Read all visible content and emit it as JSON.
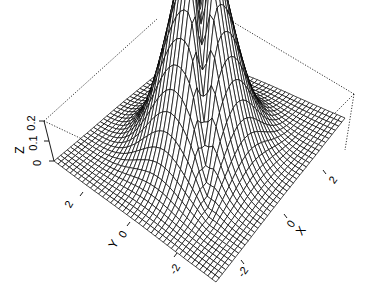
{
  "chart_data": {
    "type": "surface3d",
    "title": "",
    "function_description": "perspective mesh of a density-like surface peaking near the origin with a ridge along the back diagonal",
    "x": {
      "label": "X",
      "ticks": [
        -2,
        0,
        2
      ],
      "range": [
        -3,
        3
      ]
    },
    "y": {
      "label": "Y",
      "ticks": [
        -2,
        0,
        2
      ],
      "range": [
        -3,
        3
      ]
    },
    "z": {
      "label": "Z",
      "ticks": [
        0,
        0.1,
        0.2
      ],
      "range": [
        0,
        0.25
      ]
    },
    "grid_n": 40,
    "box": true,
    "box_style": "dotted",
    "mesh_color": "#000000",
    "background": "#ffffff"
  },
  "labels": {
    "z_axis": "Z",
    "z_ticks": [
      "0",
      "0.1",
      "0.2"
    ],
    "y_axis": "Y",
    "y_ticks": [
      "2",
      "0",
      "-2"
    ],
    "x_axis": "X",
    "x_ticks": [
      "-2",
      "0",
      "2"
    ]
  }
}
